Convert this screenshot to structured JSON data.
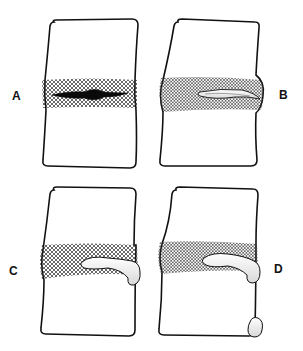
{
  "figure": {
    "type": "anatomical-diagram",
    "panels": [
      {
        "id": "A",
        "label": "A",
        "description": "vertebral bodies with disc; dark central nuclear fissure within crosshatched disc"
      },
      {
        "id": "B",
        "label": "B",
        "description": "disc bulging to the right; pale fissure extending toward right margin"
      },
      {
        "id": "C",
        "label": "C",
        "description": "disc material extruding beyond right margin of the disc"
      },
      {
        "id": "D",
        "label": "D",
        "description": "extruded fragment plus separate sequestered fragment at lower right of vertebra"
      }
    ],
    "colors": {
      "outline": "#111111",
      "background": "#ffffff",
      "hatch": "#222222",
      "fragment_fill": "#f2f2f2"
    }
  }
}
